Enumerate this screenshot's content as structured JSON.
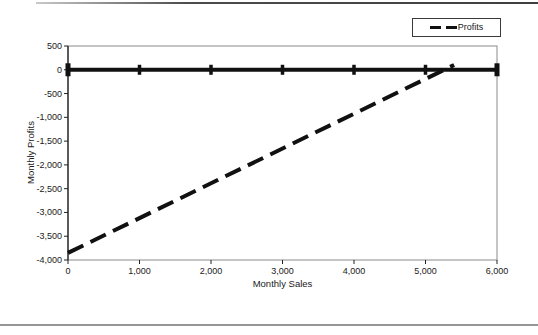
{
  "colors": {
    "background": "#ffffff",
    "text": "#1a1a1a",
    "axis": "#222222",
    "plot_border": "#8a8a8a",
    "series_line": "#111111",
    "top_rule": "#4c4c4c",
    "bottom_rule": "#969696"
  },
  "legend": {
    "entries": [
      {
        "label": "Profits",
        "line_style": "dashed"
      }
    ]
  },
  "chart_data": {
    "type": "line",
    "title": "",
    "xlabel": "Monthly Sales",
    "ylabel": "Monthly Profits",
    "xlim": [
      0,
      6000
    ],
    "ylim": [
      -4000,
      500
    ],
    "x_ticks": [
      0,
      1000,
      2000,
      3000,
      4000,
      5000,
      6000
    ],
    "x_tick_labels": [
      "0",
      "1,000",
      "2,000",
      "3,000",
      "4,000",
      "5,000",
      "6,000"
    ],
    "y_ticks": [
      500,
      0,
      -500,
      -1000,
      -1500,
      -2000,
      -2500,
      -3000,
      -3500,
      -4000
    ],
    "y_tick_labels": [
      "500",
      "0",
      "-500",
      "-1,000",
      "-1,500",
      "-2,000",
      "-2,500",
      "-3,000",
      "-3,500",
      "-4,000"
    ],
    "grid": false,
    "legend_position": "top-right-outside",
    "series": [
      {
        "name": "Break-even level",
        "in_legend": false,
        "style": "solid",
        "marker": "tick",
        "color": "#111111",
        "line_width": 4,
        "points": [
          [
            0,
            0
          ],
          [
            1000,
            0
          ],
          [
            2000,
            0
          ],
          [
            3000,
            0
          ],
          [
            4000,
            0
          ],
          [
            5000,
            0
          ],
          [
            6000,
            0
          ]
        ]
      },
      {
        "name": "Profits",
        "in_legend": true,
        "style": "dashed",
        "marker": "none",
        "color": "#111111",
        "line_width": 4,
        "points": [
          [
            0,
            -3850
          ],
          [
            5400,
            100
          ]
        ]
      }
    ]
  }
}
